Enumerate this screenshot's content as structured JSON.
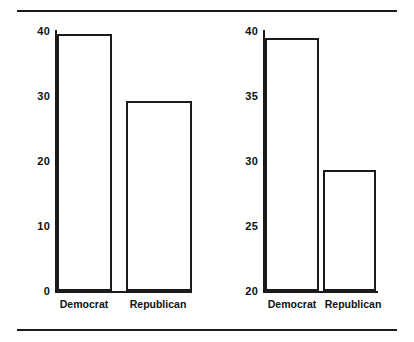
{
  "chart_data": [
    {
      "type": "bar",
      "title": "",
      "xlabel": "",
      "ylabel": "(Percent of Respondents)",
      "categories": [
        "Democrat",
        "Republican"
      ],
      "values": [
        39.5,
        29.3
      ],
      "ylim": [
        0,
        40
      ],
      "yticks": [
        0,
        10,
        20,
        30,
        40
      ],
      "ytick_labels": [
        "0",
        "10",
        "20",
        "30",
        "40"
      ],
      "grid": false,
      "legend": "none",
      "bar_fill": "#ffffff",
      "bar_edge": "#1a1a1a"
    },
    {
      "type": "bar",
      "title": "",
      "xlabel": "",
      "ylabel": "",
      "categories": [
        "Democrat",
        "Republican"
      ],
      "values": [
        39.5,
        29.3
      ],
      "ylim": [
        20,
        40
      ],
      "yticks": [
        20,
        25,
        30,
        35,
        40
      ],
      "ytick_labels": [
        "20",
        "25",
        "30",
        "35",
        "40"
      ],
      "grid": false,
      "legend": "none",
      "bar_fill": "#ffffff",
      "bar_edge": "#1a1a1a"
    }
  ],
  "left_chart": {
    "y_title": "(Percent of Respondents)",
    "ticks": [
      {
        "label": "40"
      },
      {
        "label": "30"
      },
      {
        "label": "20"
      },
      {
        "label": "10"
      },
      {
        "label": "0"
      }
    ],
    "bars": [
      {
        "label": "Democrat",
        "value": 39.5
      },
      {
        "label": "Republican",
        "value": 29.3
      }
    ]
  },
  "right_chart": {
    "ticks": [
      {
        "label": "40"
      },
      {
        "label": "35"
      },
      {
        "label": "30"
      },
      {
        "label": "25"
      },
      {
        "label": "20"
      }
    ],
    "bars": [
      {
        "label": "Democrat",
        "value": 39.5
      },
      {
        "label": "Republican",
        "value": 29.3
      }
    ]
  },
  "colors": {
    "ink": "#1a1a1a",
    "background": "#ffffff"
  }
}
